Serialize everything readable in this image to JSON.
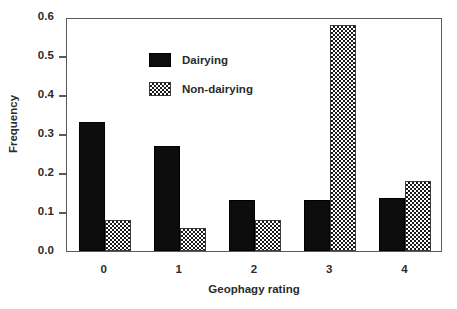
{
  "chart_data": {
    "type": "bar",
    "title": "",
    "xlabel": "Geophagy rating",
    "ylabel": "Frequency",
    "categories": [
      "0",
      "1",
      "2",
      "3",
      "4"
    ],
    "series": [
      {
        "name": "Dairying",
        "values": [
          0.33,
          0.27,
          0.13,
          0.13,
          0.135
        ],
        "style": "solid-black"
      },
      {
        "name": "Non-dairying",
        "values": [
          0.08,
          0.06,
          0.08,
          0.58,
          0.18
        ],
        "style": "checkered"
      }
    ],
    "ylim": [
      0.0,
      0.6
    ],
    "ytick_values": [
      0.0,
      0.1,
      0.2,
      0.3,
      0.4,
      0.5,
      0.6
    ],
    "ytick_labels": [
      "0.0",
      "0.1",
      "0.2",
      "0.3",
      "0.4",
      "0.5",
      "0.6"
    ],
    "grid": false,
    "legend_position": "upper-left-inside",
    "frame": "box"
  },
  "axes": {
    "y_title": "Frequency",
    "x_title": "Geophagy rating"
  },
  "legend": {
    "entries": [
      {
        "label": "Dairying",
        "style": "solid"
      },
      {
        "label": "Non-dairying",
        "style": "checker"
      }
    ]
  },
  "colors": {
    "series_dairying": "#0d0d0d",
    "series_non_dairying_pattern": "#1a1a1a",
    "axis": "#5a5a5a",
    "text": "#2b2b2b",
    "background": "#ffffff"
  }
}
